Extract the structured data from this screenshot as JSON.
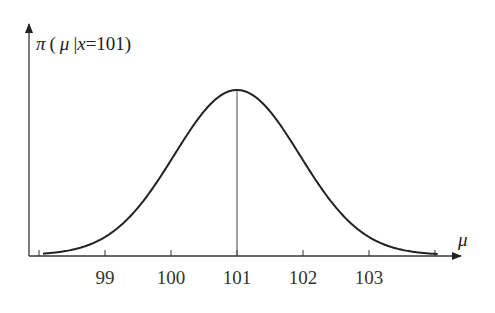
{
  "chart_data": {
    "type": "line",
    "title": "",
    "ylabel": "π(μ | x=101)",
    "xlabel": "μ",
    "ylabel_parts": {
      "pi": "π",
      "open": "(",
      "mu": "μ",
      "bar": "|",
      "x": "x",
      "eq": "=101)"
    },
    "xlabel_symbol": "μ",
    "x_ticks": [
      98,
      99,
      100,
      101,
      102,
      103,
      104
    ],
    "x_tick_labels": [
      "",
      "99",
      "100",
      "101",
      "102",
      "103",
      ""
    ],
    "xlim": [
      97.86,
      104.4
    ],
    "distribution": {
      "kind": "normal",
      "mean": 101,
      "sd": 0.95
    },
    "x": [
      98,
      98.5,
      99,
      99.5,
      100,
      100.5,
      101,
      101.5,
      102,
      102.5,
      103,
      103.5,
      104
    ],
    "values": [
      0.007,
      0.034,
      0.109,
      0.25,
      0.382,
      0.475,
      0.42,
      0.475,
      0.382,
      0.25,
      0.109,
      0.034,
      0.007
    ],
    "peak": {
      "x": 101,
      "marker": "vertical line at mean"
    },
    "grid": false,
    "legend": null
  },
  "labels": {
    "pi": "π",
    "paren_open": "(",
    "mu": "μ",
    "bar": "|",
    "x": "x",
    "rest": "=101)",
    "xaxis_mu": "μ"
  }
}
